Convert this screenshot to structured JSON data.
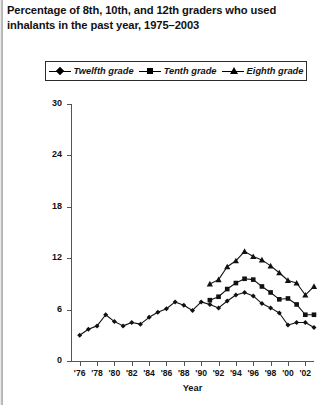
{
  "chart": {
    "title": "Percentage of 8th, 10th, and 12th graders who used inhalants in the past year, 1975–2003",
    "x_axis_title": "Year",
    "legend": [
      {
        "label": "Twelfth grade",
        "marker": "diamond"
      },
      {
        "label": "Tenth grade",
        "marker": "square"
      },
      {
        "label": "Eighth grade",
        "marker": "triangle"
      }
    ],
    "y_tick_labels": [
      "0",
      "6",
      "12",
      "18",
      "24",
      "30"
    ],
    "x_tick_labels": [
      "'76",
      "'78",
      "'80",
      "'82",
      "'84",
      "'86",
      "'88",
      "'90",
      "'92",
      "'94",
      "'96",
      "'98",
      "'00",
      "'02"
    ]
  },
  "chart_data": {
    "type": "line",
    "title": "Percentage of 8th, 10th, and 12th graders who used inhalants in the past year, 1975–2003",
    "xlabel": "Year",
    "ylabel": "",
    "xlim": [
      1975,
      2003
    ],
    "ylim": [
      0,
      30
    ],
    "yticks": [
      0,
      6,
      12,
      18,
      24,
      30
    ],
    "xticks": [
      1976,
      1978,
      1980,
      1982,
      1984,
      1986,
      1988,
      1990,
      1992,
      1994,
      1996,
      1998,
      2000,
      2002
    ],
    "grid": false,
    "legend_position": "top",
    "x": [
      1976,
      1977,
      1978,
      1979,
      1980,
      1981,
      1982,
      1983,
      1984,
      1985,
      1986,
      1987,
      1988,
      1989,
      1990,
      1991,
      1992,
      1993,
      1994,
      1995,
      1996,
      1997,
      1998,
      1999,
      2000,
      2001,
      2002,
      2003
    ],
    "series": [
      {
        "name": "Twelfth grade",
        "marker": "diamond",
        "x": [
          1976,
          1977,
          1978,
          1979,
          1980,
          1981,
          1982,
          1983,
          1984,
          1985,
          1986,
          1987,
          1988,
          1989,
          1990,
          1991,
          1992,
          1993,
          1994,
          1995,
          1996,
          1997,
          1998,
          1999,
          2000,
          2001,
          2002,
          2003
        ],
        "values": [
          3.0,
          3.7,
          4.1,
          5.4,
          4.6,
          4.1,
          4.5,
          4.3,
          5.1,
          5.7,
          6.1,
          6.9,
          6.5,
          5.9,
          6.9,
          6.6,
          6.2,
          7.0,
          7.7,
          8.0,
          7.6,
          6.7,
          6.2,
          5.6,
          4.2,
          4.5,
          4.5,
          3.9
        ]
      },
      {
        "name": "Tenth grade",
        "marker": "square",
        "x": [
          1991,
          1992,
          1993,
          1994,
          1995,
          1996,
          1997,
          1998,
          1999,
          2000,
          2001,
          2002,
          2003
        ],
        "values": [
          7.1,
          7.5,
          8.4,
          9.1,
          9.6,
          9.5,
          8.7,
          8.0,
          7.2,
          7.3,
          6.6,
          5.4,
          5.4
        ]
      },
      {
        "name": "Eighth grade",
        "marker": "triangle",
        "x": [
          1991,
          1992,
          1993,
          1994,
          1995,
          1996,
          1997,
          1998,
          1999,
          2000,
          2001,
          2002,
          2003
        ],
        "values": [
          9.0,
          9.5,
          11.0,
          11.7,
          12.8,
          12.2,
          11.8,
          11.1,
          10.3,
          9.4,
          9.1,
          7.7,
          8.7
        ]
      }
    ]
  }
}
